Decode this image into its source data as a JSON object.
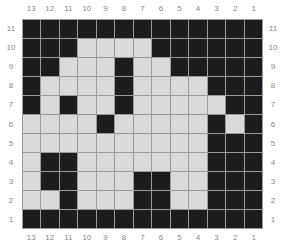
{
  "board": {
    "column_labels": [
      "13",
      "12",
      "11",
      "10",
      "9",
      "8",
      "7",
      "6",
      "5",
      "4",
      "3",
      "2",
      "1"
    ],
    "row_labels": [
      "11",
      "10",
      "9",
      "8",
      "7",
      "6",
      "5",
      "4",
      "3",
      "2",
      "1"
    ],
    "colors": {
      "filled": "#1c1c1c",
      "empty": "#d9d9d9",
      "grid_line": "#9a9a9a",
      "label": "#8a8a8a"
    },
    "rows": [
      "BBBBBBBBBBBBB",
      "BBBWWWWBBBBBB",
      "BBWWWBWWBBBBB",
      "BWWWWBWWWWBBB",
      "BWBWWBWWWWWBB",
      "WWWWBWWWWWBWB",
      "WWWWWWWWWWBBB",
      "WBBWWWWWWWBBB",
      "WBBWWWBBWWBBB",
      "WWBWWWBBWWBBB",
      "BBBBBBBBBBBBB"
    ]
  }
}
